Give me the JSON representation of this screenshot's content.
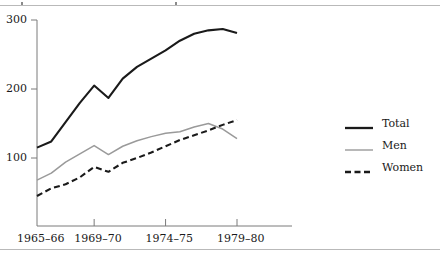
{
  "figure": {
    "has_top_rule": true,
    "has_bottom_rule": true
  },
  "chart_data": {
    "type": "line",
    "title": "",
    "subtitle": "",
    "xlabel": "",
    "ylabel": "",
    "grid": false,
    "legend_position": "right",
    "x": [
      "1965-66",
      "1966-67",
      "1967-68",
      "1968-69",
      "1969-70",
      "1970-71",
      "1971-72",
      "1972-73",
      "1973-74",
      "1974-75",
      "1975-76",
      "1976-77",
      "1977-78",
      "1978-79",
      "1979-80"
    ],
    "x_tick_labels": [
      "1965–66",
      "1969–70",
      "1974–75",
      "1979–80"
    ],
    "x_tick_values": [
      "1965-66",
      "1969-70",
      "1974-75",
      "1979-80"
    ],
    "y_tick_labels": [
      "100",
      "200",
      "300"
    ],
    "y_tick_values": [
      100,
      200,
      300
    ],
    "ylim": [
      0,
      310
    ],
    "series": [
      {
        "name": "Total",
        "style": "solid",
        "color": "#1a1a1a",
        "width": 2.1,
        "values": [
          115,
          124,
          152,
          180,
          205,
          187,
          215,
          232,
          244,
          256,
          270,
          280,
          285,
          287,
          281
        ]
      },
      {
        "name": "Men",
        "style": "solid",
        "color": "#9a9a9a",
        "width": 1.5,
        "values": [
          68,
          78,
          94,
          106,
          118,
          105,
          117,
          125,
          131,
          136,
          138,
          145,
          150,
          142,
          128
        ]
      },
      {
        "name": "Women",
        "style": "dashed",
        "color": "#1a1a1a",
        "width": 2.1,
        "values": [
          45,
          56,
          62,
          72,
          87,
          80,
          93,
          100,
          108,
          117,
          126,
          133,
          140,
          148,
          155
        ]
      }
    ]
  },
  "legend": {
    "items": [
      {
        "label": "Total",
        "style": "solid",
        "color": "#1a1a1a",
        "width": 2.3
      },
      {
        "label": "Men",
        "style": "solid",
        "color": "#9a9a9a",
        "width": 1.4
      },
      {
        "label": "Women",
        "style": "dashed",
        "color": "#1a1a1a",
        "width": 2.3
      }
    ]
  },
  "axes": {
    "plot_left": 37,
    "plot_right": 292,
    "data_right": 237,
    "y_top_px": 20,
    "y_bottom_px": 226,
    "y_300_px": 20,
    "y_200_px": 89,
    "y_100_px": 158
  }
}
